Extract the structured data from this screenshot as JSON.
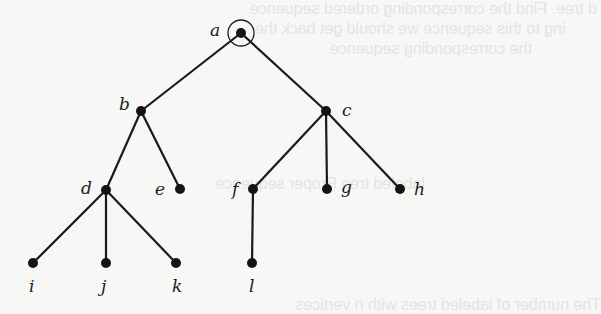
{
  "diagram": {
    "type": "rooted-tree",
    "root": "a",
    "nodes": [
      {
        "id": "a",
        "label": "a",
        "x": 241,
        "y": 33,
        "lx": 210,
        "ly": 36
      },
      {
        "id": "b",
        "label": "b",
        "x": 141,
        "y": 111,
        "lx": 119,
        "ly": 110
      },
      {
        "id": "c",
        "label": "c",
        "x": 326,
        "y": 111,
        "lx": 342,
        "ly": 116
      },
      {
        "id": "d",
        "label": "d",
        "x": 106,
        "y": 190,
        "lx": 81,
        "ly": 194
      },
      {
        "id": "e",
        "label": "e",
        "x": 180,
        "y": 189,
        "lx": 155,
        "ly": 195
      },
      {
        "id": "f",
        "label": "f",
        "x": 253,
        "y": 189,
        "lx": 232,
        "ly": 195
      },
      {
        "id": "g",
        "label": "g",
        "x": 327,
        "y": 189,
        "lx": 341,
        "ly": 193
      },
      {
        "id": "h",
        "label": "h",
        "x": 400,
        "y": 189,
        "lx": 414,
        "ly": 195
      },
      {
        "id": "i",
        "label": "i",
        "x": 33,
        "y": 263,
        "lx": 29,
        "ly": 292
      },
      {
        "id": "j",
        "label": "j",
        "x": 106,
        "y": 263,
        "lx": 101,
        "ly": 292
      },
      {
        "id": "k",
        "label": "k",
        "x": 176,
        "y": 263,
        "lx": 172,
        "ly": 292
      },
      {
        "id": "l",
        "label": "l",
        "x": 252,
        "y": 263,
        "lx": 249,
        "ly": 292
      }
    ],
    "edges": [
      [
        "a",
        "b"
      ],
      [
        "a",
        "c"
      ],
      [
        "b",
        "d"
      ],
      [
        "b",
        "e"
      ],
      [
        "c",
        "f"
      ],
      [
        "c",
        "g"
      ],
      [
        "c",
        "h"
      ],
      [
        "d",
        "i"
      ],
      [
        "d",
        "j"
      ],
      [
        "d",
        "k"
      ],
      [
        "f",
        "l"
      ]
    ],
    "root_marker": "circle"
  },
  "background": {
    "ghost_text": [
      {
        "text": "d tree. Find the corresponding ordered sequence",
        "x": 250,
        "y": 0
      },
      {
        "text": "ing to this sequence we should get back the",
        "x": 255,
        "y": 20
      },
      {
        "text": "the corresponding sequence",
        "x": 330,
        "y": 40
      },
      {
        "text": "labeled tree      Proper sequence",
        "x": 215,
        "y": 175
      },
      {
        "text": "The number of labeled trees with n vertices",
        "x": 295,
        "y": 296
      }
    ]
  }
}
